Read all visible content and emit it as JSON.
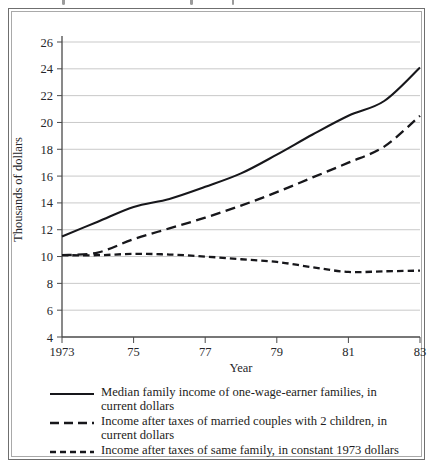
{
  "figure": {
    "border_color": "#6f6f6f",
    "inner_border_color": "#a9a9a9"
  },
  "axes": {
    "y_axis_title": "Thousands of dollars",
    "x_axis_title": "Year",
    "y_ticks": [
      "26",
      "24",
      "22",
      "20",
      "18",
      "16",
      "14",
      "12",
      "10",
      "8",
      "6",
      "4"
    ],
    "x_ticks": [
      "1973",
      "75",
      "77",
      "79",
      "81",
      "83"
    ],
    "grid_color": "#c9c9c9",
    "axis_color": "#4a4a4a",
    "line_color": "#17171b"
  },
  "legend": {
    "items": [
      {
        "style": "solid",
        "label": "Median family income of one-wage-earner families, in current dollars"
      },
      {
        "style": "long-dash",
        "label": "Income after taxes of married couples with 2 children, in current dollars"
      },
      {
        "style": "short-dash",
        "label": "Income after taxes of same family, in constant 1973 dollars"
      }
    ]
  },
  "chart_data": {
    "type": "line",
    "title": "",
    "xlabel": "Year",
    "ylabel": "Thousands of dollars",
    "xlim": [
      1973,
      1983
    ],
    "ylim": [
      4,
      26
    ],
    "y_ticks": [
      4,
      6,
      8,
      10,
      12,
      14,
      16,
      18,
      20,
      22,
      24,
      26
    ],
    "x_ticks": [
      1973,
      1975,
      1977,
      1979,
      1981,
      1983
    ],
    "x_tick_labels": [
      "1973",
      "75",
      "77",
      "79",
      "81",
      "83"
    ],
    "grid": "horizontal",
    "legend_position": "below",
    "x": [
      1973,
      1974,
      1975,
      1976,
      1977,
      1978,
      1979,
      1980,
      1981,
      1982,
      1983
    ],
    "series": [
      {
        "name": "Median family income of one-wage-earner families, in current dollars",
        "style": "solid",
        "values": [
          11.5,
          12.6,
          13.7,
          14.3,
          15.2,
          16.2,
          17.6,
          19.1,
          20.5,
          21.6,
          24.1
        ]
      },
      {
        "name": "Income after taxes of married couples with 2 children, in current dollars",
        "style": "long-dash",
        "values": [
          10.1,
          10.3,
          11.3,
          12.1,
          12.9,
          13.8,
          14.8,
          15.9,
          17.0,
          18.2,
          20.5
        ]
      },
      {
        "name": "Income after taxes of same family, in constant 1973 dollars",
        "style": "short-dash",
        "values": [
          10.1,
          10.1,
          10.2,
          10.15,
          10.0,
          9.8,
          9.6,
          9.2,
          8.85,
          8.9,
          8.95
        ]
      }
    ]
  }
}
